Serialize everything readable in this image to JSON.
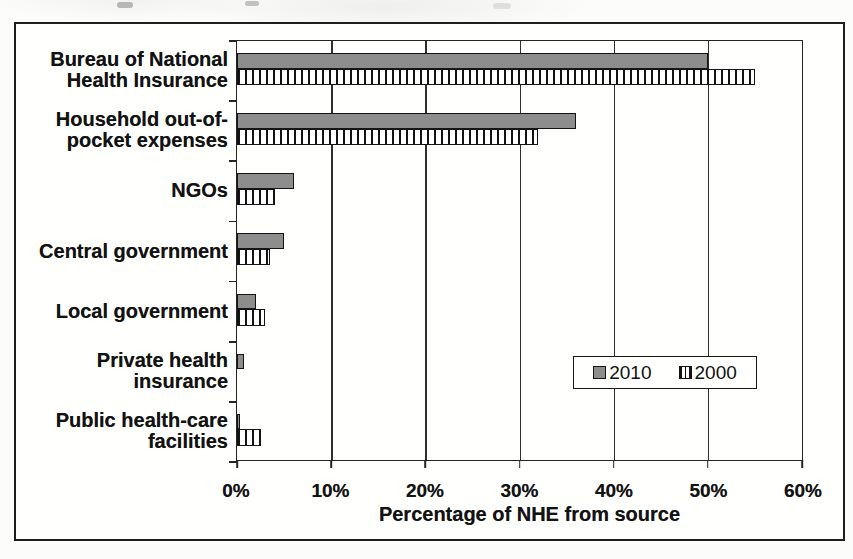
{
  "chart_data": {
    "type": "bar",
    "orientation": "horizontal",
    "title": "",
    "xlabel": "Percentage of NHE from source",
    "ylabel": "",
    "xlim": [
      0,
      60
    ],
    "x_tick_labels": [
      "0%",
      "10%",
      "20%",
      "30%",
      "40%",
      "50%",
      "60%"
    ],
    "grid": true,
    "legend_position": "inside-lower-right",
    "categories": [
      "Bureau of National Health Insurance",
      "Household out-of-pocket expenses",
      "NGOs",
      "Central government",
      "Local government",
      "Private health insurance",
      "Public health-care facilities"
    ],
    "category_label_lines": [
      [
        "Bureau of National",
        "Health Insurance"
      ],
      [
        "Household out-of-",
        "pocket expenses"
      ],
      [
        "NGOs"
      ],
      [
        "Central government"
      ],
      [
        "Local government"
      ],
      [
        "Private health",
        "insurance"
      ],
      [
        "Public health-care",
        "facilities"
      ]
    ],
    "series": [
      {
        "name": "2010",
        "style": "solid",
        "color": "#8d8d8d",
        "values": [
          50,
          36,
          6,
          5,
          2,
          0.7,
          0.3
        ]
      },
      {
        "name": "2000",
        "style": "hatched-vertical",
        "color": "#ffffff",
        "values": [
          55,
          32,
          4,
          3.5,
          3,
          0,
          2.5
        ]
      }
    ]
  },
  "legend": {
    "items": [
      {
        "label": "2010"
      },
      {
        "label": "2000"
      }
    ]
  },
  "axis": {
    "x_title": "Percentage of NHE from source"
  },
  "colors": {
    "bar_2010_fill": "#8d8d8d",
    "bar_border": "#141414",
    "grid_line": "#2e2e2e",
    "frame_border": "#1e1e1e"
  }
}
